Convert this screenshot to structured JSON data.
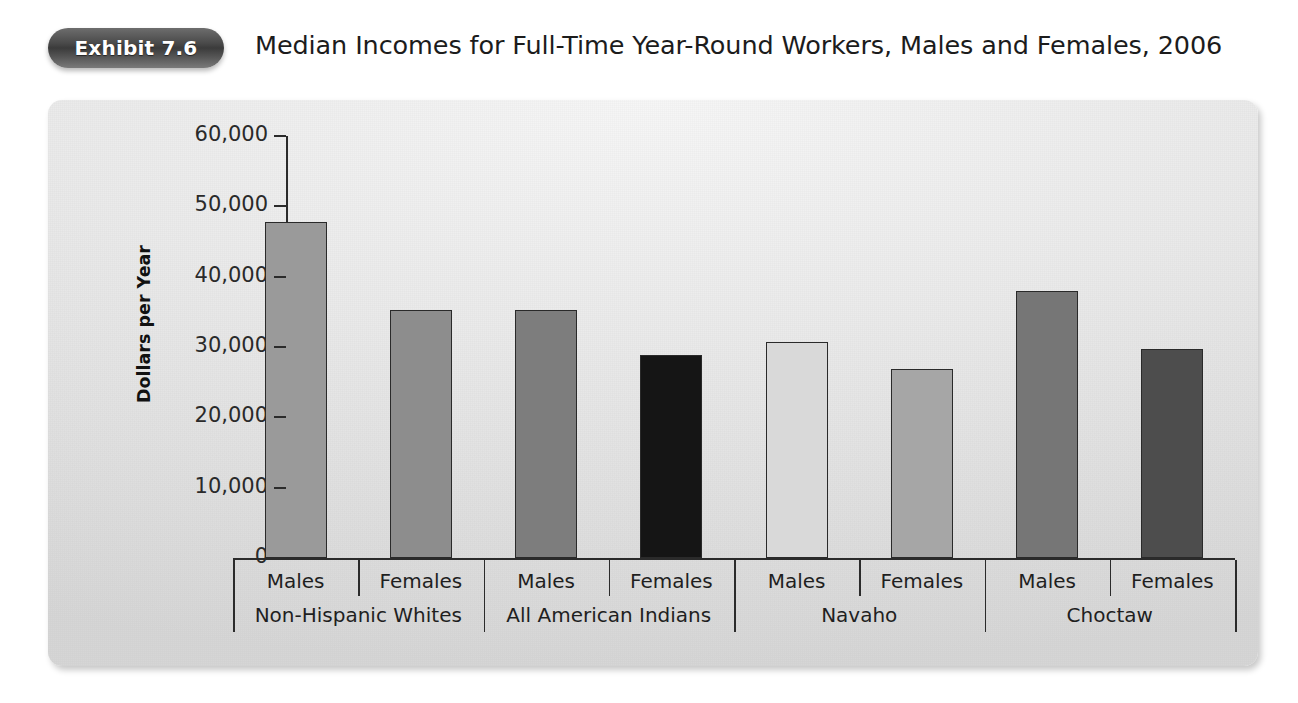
{
  "header": {
    "badge_label": "Exhibit 7.6",
    "title": "Median Incomes for Full-Time Year-Round Workers, Males and Females, 2006"
  },
  "chart_data": {
    "type": "bar",
    "title": "Median Incomes for Full-Time Year-Round Workers, Males and Females, 2006",
    "xlabel": "",
    "ylabel": "Dollars per Year",
    "ylim": [
      0,
      60000
    ],
    "ytick_labels": [
      "60,000",
      "50,000",
      "40,000",
      "30,000",
      "20,000",
      "10,000",
      "0"
    ],
    "ytick_values": [
      60000,
      50000,
      40000,
      30000,
      20000,
      10000,
      0
    ],
    "grid": false,
    "legend": "none",
    "groups": [
      "Non-Hispanic Whites",
      "All American Indians",
      "Navaho",
      "Choctaw"
    ],
    "subcategories": [
      "Males",
      "Females"
    ],
    "categories": [
      "Non-Hispanic Whites Males",
      "Non-Hispanic Whites Females",
      "All American Indians Males",
      "All American Indians Females",
      "Navaho Males",
      "Navaho Females",
      "Choctaw Males",
      "Choctaw Females"
    ],
    "values": [
      47800,
      35200,
      35200,
      28900,
      30700,
      26900,
      37900,
      29700
    ],
    "bar_colors": [
      "#9a9a9a",
      "#8d8d8d",
      "#7d7d7d",
      "#151515",
      "#d9d9d9",
      "#a6a6a6",
      "#767676",
      "#4d4d4d"
    ],
    "bars": [
      {
        "label": "Males",
        "group": "Non-Hispanic Whites",
        "value": 47800,
        "color": "#9a9a9a"
      },
      {
        "label": "Females",
        "group": "Non-Hispanic Whites",
        "value": 35200,
        "color": "#8d8d8d"
      },
      {
        "label": "Males",
        "group": "All American Indians",
        "value": 35200,
        "color": "#7d7d7d"
      },
      {
        "label": "Females",
        "group": "All American Indians",
        "value": 28900,
        "color": "#151515"
      },
      {
        "label": "Males",
        "group": "Navaho",
        "value": 30700,
        "color": "#d9d9d9"
      },
      {
        "label": "Females",
        "group": "Navaho",
        "value": 26900,
        "color": "#a6a6a6"
      },
      {
        "label": "Males",
        "group": "Choctaw",
        "value": 37900,
        "color": "#767676"
      },
      {
        "label": "Females",
        "group": "Choctaw",
        "value": 29700,
        "color": "#4d4d4d"
      }
    ]
  },
  "colors": {
    "axis": "#2b2b2b",
    "text": "#1f1f1f",
    "panel_light": "#f2f2f2",
    "panel_dark": "#d6d6d6",
    "badge_dark": "#3b3b3b"
  }
}
